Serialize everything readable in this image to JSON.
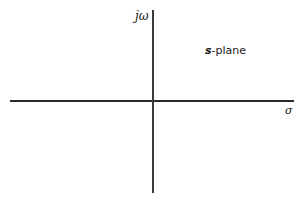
{
  "diagram": {
    "title": "s-plane",
    "plane_label": {
      "variable": "s",
      "suffix": "-plane"
    },
    "axes": {
      "vertical": {
        "label": "jω",
        "meaning": "imaginary axis"
      },
      "horizontal": {
        "label": "σ",
        "meaning": "real axis"
      }
    }
  }
}
